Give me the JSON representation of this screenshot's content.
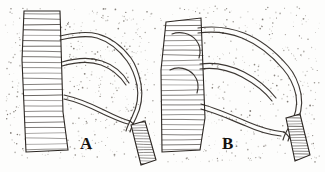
{
  "plate": {
    "background_color": "#fdfdfc",
    "ink_color": "#2b2622",
    "stipple_color": "#5c554d",
    "figures": [
      {
        "id": "A",
        "label": "A",
        "label_x": 80,
        "label_y": 134,
        "description": "nerve trunk with vascular loops"
      },
      {
        "id": "B",
        "label": "B",
        "label_x": 222,
        "label_y": 134,
        "description": "nerve trunk with vascular loops"
      }
    ]
  },
  "figure_a": {
    "trunk": {
      "name": "striated-trunk",
      "outline": "M24,11 L60,11 L63,112 L68,150 L26,152 L22,60 Z",
      "striation_count": 26
    },
    "vessels": [
      {
        "name": "upper-arch",
        "path": "M60,36 C74,33 86,31 98,34 C112,38 122,46 131,58 C136,65 139,74 141,84"
      },
      {
        "name": "upper-arch-inner",
        "path": "M60,40 C74,37 86,35 97,38 C110,42 119,50 127,61 C132,68 135,76 137,85"
      },
      {
        "name": "mid-loop",
        "path": "M62,62 C76,58 90,57 102,61 C114,65 123,73 129,83"
      },
      {
        "name": "mid-loop-inner",
        "path": "M62,66 C76,62 90,61 101,65 C112,69 120,76 126,85"
      },
      {
        "name": "lower-arch",
        "path": "M64,95 C78,98 92,104 104,110 C114,115 122,119 130,121"
      },
      {
        "name": "lower-arch-inner",
        "path": "M64,99 C78,102 91,108 103,114 C112,118 120,122 128,124"
      },
      {
        "name": "descending-branch",
        "path": "M141,84 C143,96 141,108 136,118 C133,124 131,128 130,132"
      },
      {
        "name": "descending-branch-inner",
        "path": "M137,85 C139,96 137,107 132,117 C129,123 127,127 126,131"
      },
      {
        "name": "junction-stem",
        "path": "M130,121 C134,124 137,128 139,133"
      }
    ],
    "band": {
      "name": "striated-band",
      "outline": "M131,125 L145,121 L156,160 L141,165 Z",
      "striation_count": 16
    }
  },
  "figure_b": {
    "trunk": {
      "name": "striated-trunk",
      "outline": "M166,22 L201,18 L205,118 L200,150 L162,152 L161,70 Z",
      "striation_count": 27
    },
    "vessels": [
      {
        "name": "upper-arch",
        "path": "M198,28 C212,26 228,27 244,33 C262,40 276,52 288,66 C295,74 299,84 301,94"
      },
      {
        "name": "upper-arch-inner",
        "path": "M198,33 C212,31 227,32 242,38 C259,45 272,56 283,69 C290,77 294,86 296,95"
      },
      {
        "name": "mid-loop",
        "path": "M200,64 C214,62 230,65 244,72 C258,79 268,88 276,98"
      },
      {
        "name": "mid-loop-inner",
        "path": "M200,69 C214,67 229,70 242,77 C255,84 265,92 272,101"
      },
      {
        "name": "lower-arch",
        "path": "M201,104 C216,108 232,115 248,122 C262,128 274,131 284,132"
      },
      {
        "name": "lower-arch-inner",
        "path": "M201,109 C216,113 231,120 246,126 C259,132 271,135 281,136"
      },
      {
        "name": "descending-branch",
        "path": "M301,94 C303,106 300,118 294,128 C291,133 289,137 288,141"
      },
      {
        "name": "descending-branch-inner",
        "path": "M296,95 C298,106 295,117 289,127 C286,132 284,136 283,140"
      },
      {
        "name": "intra-trunk-loop",
        "path": "M172,34 C180,31 190,33 196,40 C200,45 201,52 199,58"
      },
      {
        "name": "intra-trunk-loop-2",
        "path": "M170,70 C178,66 188,68 194,75 C198,80 199,87 197,93"
      },
      {
        "name": "junction-stem",
        "path": "M284,132 C288,135 291,139 293,144"
      }
    ],
    "band": {
      "name": "striated-band",
      "outline": "M286,118 L300,114 L310,155 L295,161 Z",
      "striation_count": 17
    }
  },
  "stipple": {
    "name": "stipple-field",
    "seed": 20240517,
    "regions": [
      {
        "x": 5,
        "y": 8,
        "w": 150,
        "h": 150,
        "count": 520
      },
      {
        "x": 160,
        "y": 6,
        "w": 160,
        "h": 156,
        "count": 470
      }
    ]
  }
}
